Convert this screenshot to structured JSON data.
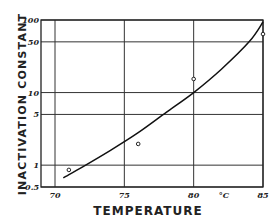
{
  "chart_data": {
    "type": "scatter",
    "title": "",
    "xlabel": "TEMPERATURE",
    "ylabel": "INACTIVATION CONSTANT",
    "x_unit_label": "°C",
    "xlim": [
      70,
      85
    ],
    "ylim": [
      0.5,
      100
    ],
    "yscale": "log",
    "grid": true,
    "x_ticks": [
      70,
      75,
      80,
      85
    ],
    "x_tick_labels": [
      "70",
      "75",
      "80",
      "85"
    ],
    "y_ticks": [
      0.5,
      1,
      5,
      10,
      50,
      100
    ],
    "y_tick_labels": [
      "0.5",
      "1",
      "5",
      "10",
      "50",
      "100"
    ],
    "series": [
      {
        "name": "observed",
        "kind": "points",
        "marker": "open-circle",
        "x": [
          71,
          76,
          80,
          85
        ],
        "y": [
          0.86,
          1.96,
          15.4,
          64
        ]
      },
      {
        "name": "fitted curve",
        "kind": "line",
        "x": [
          70.6,
          72,
          74,
          76,
          78,
          80,
          82,
          84,
          85
        ],
        "y": [
          0.67,
          0.95,
          1.6,
          2.8,
          5.3,
          10,
          21,
          50,
          94
        ]
      }
    ]
  }
}
